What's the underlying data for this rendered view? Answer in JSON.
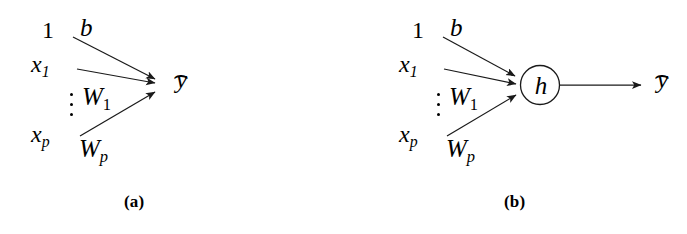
{
  "figure": {
    "background_color": "#ffffff",
    "stroke_color": "#1a1a1a",
    "width": 687,
    "height": 234
  },
  "panels": [
    {
      "id": "a",
      "caption": "(a)",
      "inputs": [
        {
          "name": "bias-input",
          "label": "1"
        },
        {
          "name": "x1-input",
          "base": "x",
          "sub": "1"
        },
        {
          "name": "xp-input",
          "base": "x",
          "sub": "p"
        }
      ],
      "vertical_dots": "⋮",
      "weights": [
        {
          "name": "bias-weight",
          "base": "b",
          "sub": ""
        },
        {
          "name": "w1-weight",
          "base": "W",
          "sub": "1"
        },
        {
          "name": "wp-weight",
          "base": "W",
          "sub": "p"
        }
      ],
      "output": {
        "base": "y",
        "hat": "⌢",
        "label": "ŷ"
      },
      "has_node": false,
      "node_label": ""
    },
    {
      "id": "b",
      "caption": "(b)",
      "inputs": [
        {
          "name": "bias-input",
          "label": "1"
        },
        {
          "name": "x1-input",
          "base": "x",
          "sub": "1"
        },
        {
          "name": "xp-input",
          "base": "x",
          "sub": "p"
        }
      ],
      "vertical_dots": "⋮",
      "weights": [
        {
          "name": "bias-weight",
          "base": "b",
          "sub": ""
        },
        {
          "name": "w1-weight",
          "base": "W",
          "sub": "1"
        },
        {
          "name": "wp-weight",
          "base": "W",
          "sub": "p"
        }
      ],
      "output": {
        "base": "y",
        "hat": "⌢",
        "label": "ŷ"
      },
      "has_node": true,
      "node_label": "h"
    }
  ]
}
